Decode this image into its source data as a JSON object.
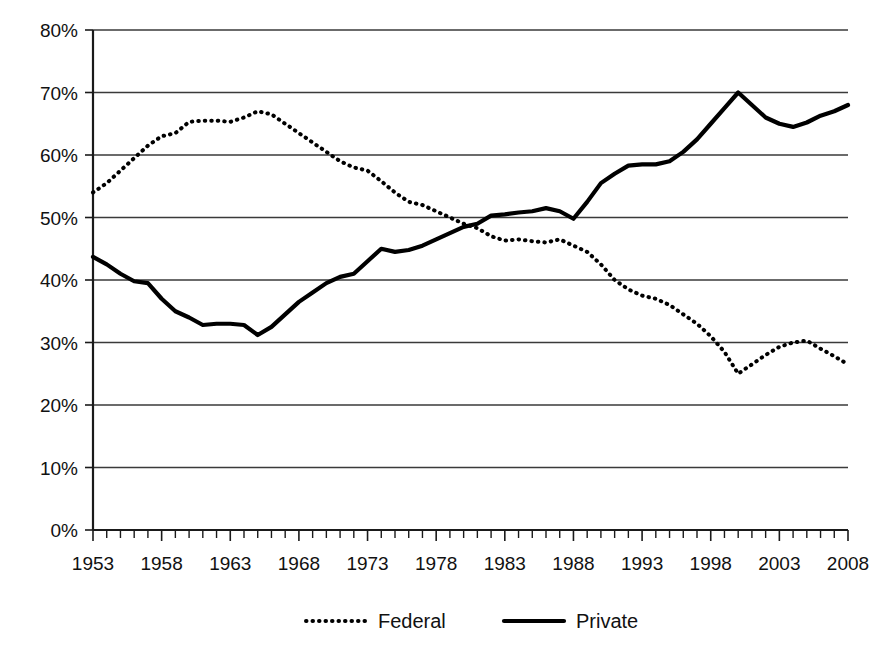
{
  "chart_data": {
    "type": "line",
    "title": "",
    "subtitle": "",
    "xlabel": "",
    "ylabel": "",
    "xlim": [
      1953,
      2008
    ],
    "ylim": [
      0,
      80
    ],
    "grid": true,
    "legend_position": "bottom",
    "y_tick_labels": [
      "80%",
      "70%",
      "60%",
      "50%",
      "40%",
      "30%",
      "20%",
      "10%",
      "0%"
    ],
    "y_tick_values": [
      80,
      70,
      60,
      50,
      40,
      30,
      20,
      10,
      0
    ],
    "x_tick_labels": [
      "1953",
      "1958",
      "1963",
      "1968",
      "1973",
      "1978",
      "1983",
      "1988",
      "1993",
      "1998",
      "2003",
      "2008"
    ],
    "x_tick_values": [
      1953,
      1958,
      1963,
      1968,
      1973,
      1978,
      1983,
      1988,
      1993,
      1998,
      2003,
      2008
    ],
    "x_minor_tick_interval": 1,
    "x": [
      1953,
      1954,
      1955,
      1956,
      1957,
      1958,
      1959,
      1960,
      1961,
      1962,
      1963,
      1964,
      1965,
      1966,
      1967,
      1968,
      1969,
      1970,
      1971,
      1972,
      1973,
      1974,
      1975,
      1976,
      1977,
      1978,
      1979,
      1980,
      1981,
      1982,
      1983,
      1984,
      1985,
      1986,
      1987,
      1988,
      1989,
      1990,
      1991,
      1992,
      1993,
      1994,
      1995,
      1996,
      1997,
      1998,
      1999,
      2000,
      2001,
      2002,
      2003,
      2004,
      2005,
      2006,
      2007,
      2008
    ],
    "series": [
      {
        "name": "Federal",
        "style": "dotted",
        "color": "#000000",
        "values": [
          54.0,
          55.5,
          57.5,
          59.5,
          61.5,
          63.0,
          63.5,
          65.3,
          65.5,
          65.5,
          65.3,
          66.0,
          67.0,
          66.5,
          65.0,
          63.5,
          62.0,
          60.5,
          59.0,
          58.0,
          57.5,
          55.8,
          54.0,
          52.5,
          52.0,
          51.0,
          50.0,
          49.0,
          48.3,
          47.0,
          46.3,
          46.5,
          46.2,
          46.0,
          46.5,
          45.5,
          44.5,
          42.5,
          40.0,
          38.5,
          37.5,
          37.0,
          36.0,
          34.5,
          33.0,
          31.0,
          28.5,
          25.0,
          26.5,
          28.0,
          29.3,
          30.0,
          30.3,
          29.0,
          27.8,
          26.5
        ]
      },
      {
        "name": "Private",
        "style": "solid",
        "color": "#000000",
        "values": [
          43.7,
          42.5,
          41.0,
          39.8,
          39.5,
          37.0,
          35.0,
          34.0,
          32.8,
          33.0,
          33.0,
          32.8,
          31.2,
          32.5,
          34.5,
          36.5,
          38.0,
          39.5,
          40.5,
          41.0,
          43.0,
          45.0,
          44.5,
          44.8,
          45.5,
          46.5,
          47.5,
          48.5,
          49.0,
          50.3,
          50.5,
          50.8,
          51.0,
          51.5,
          51.0,
          49.8,
          52.5,
          55.5,
          57.0,
          58.3,
          58.5,
          58.5,
          59.0,
          60.5,
          62.5,
          65.0,
          67.5,
          70.0,
          68.0,
          66.0,
          65.0,
          64.5,
          65.2,
          66.3,
          67.0,
          68.0
        ]
      }
    ],
    "legend": [
      {
        "label": "Federal",
        "style": "dotted"
      },
      {
        "label": "Private",
        "style": "solid"
      }
    ]
  }
}
